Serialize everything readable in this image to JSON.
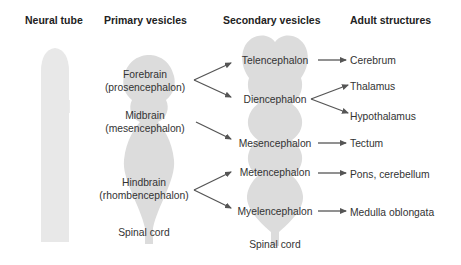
{
  "headers": {
    "neural_tube": "Neural tube",
    "primary": "Primary vesicles",
    "secondary": "Secondary vesicles",
    "adult": "Adult structures"
  },
  "primary_vesicles": [
    {
      "name": "Forebrain",
      "latin": "(prosencephalon)"
    },
    {
      "name": "Midbrain",
      "latin": "(mesencephalon)"
    },
    {
      "name": "Hindbrain",
      "latin": "(rhombencephalon)"
    },
    {
      "name": "Spinal cord"
    }
  ],
  "secondary_vesicles": [
    "Telencephalon",
    "Diencephalon",
    "Mesencephalon",
    "Metencephalon",
    "Myelencephalon",
    "Spinal cord"
  ],
  "adult_structures": [
    "Cerebrum",
    "Thalamus",
    "Hypothalamus",
    "Tectum",
    "Pons, cerebellum",
    "Medulla oblongata"
  ],
  "colors": {
    "shape_fill": "#dcdcdc",
    "tube_fill": "#e9e9e9",
    "arrow": "#555555"
  }
}
